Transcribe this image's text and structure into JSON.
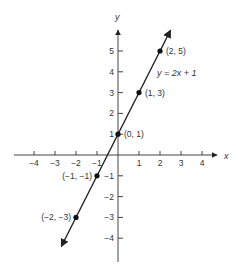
{
  "chart_data": {
    "type": "line",
    "title": "",
    "xlabel": "x",
    "ylabel": "y",
    "equation": "y = 2x + 1",
    "xlim": [
      -4.6,
      4.8
    ],
    "ylim": [
      -5.0,
      6.2
    ],
    "x_ticks": [
      -4,
      -3,
      -2,
      -1,
      1,
      2,
      3,
      4
    ],
    "y_ticks": [
      -4,
      -3,
      -2,
      -1,
      1,
      2,
      3,
      4,
      5
    ],
    "grid": false,
    "series": [
      {
        "name": "y = 2x + 1",
        "slope": 2,
        "intercept": 1,
        "line_extent_x": [
          -2.7,
          2.5
        ],
        "arrows_both_ends": true
      }
    ],
    "points": [
      {
        "x": 2,
        "y": 5,
        "label": "(2, 5)"
      },
      {
        "x": 1,
        "y": 3,
        "label": "(1, 3)"
      },
      {
        "x": 0,
        "y": 1,
        "label": "(0, 1)"
      },
      {
        "x": -1,
        "y": -1,
        "label": "(−1, −1)"
      },
      {
        "x": -2,
        "y": -3,
        "label": "(−2, −3)"
      }
    ]
  },
  "labels": {
    "x_axis": "x",
    "y_axis": "y",
    "equation": "y = 2x + 1",
    "x_ticks": [
      "−4",
      "−3",
      "−2",
      "−1",
      "1",
      "2",
      "3",
      "4"
    ],
    "y_ticks": [
      "−4",
      "−3",
      "−2",
      "−1",
      "1",
      "2",
      "3",
      "4",
      "5"
    ],
    "points": [
      "(2, 5)",
      "(1, 3)",
      "(0, 1)",
      "(−1, −1)",
      "(−2, −3)"
    ]
  },
  "colors": {
    "axis": "#444444",
    "line": "#222222",
    "point": "#111111",
    "text": "#333333"
  }
}
